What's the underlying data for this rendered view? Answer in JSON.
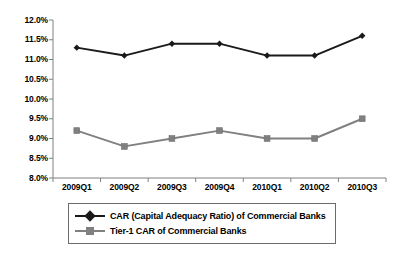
{
  "chart_data": {
    "type": "line",
    "title": "",
    "xlabel": "",
    "ylabel": "",
    "categories": [
      "2009Q1",
      "2009Q2",
      "2009Q3",
      "2009Q4",
      "2010Q1",
      "2010Q2",
      "2010Q3"
    ],
    "series": [
      {
        "name": "CAR (Capital Adequacy Ratio) of Commercial Banks",
        "values": [
          11.3,
          11.1,
          11.4,
          11.4,
          11.1,
          11.1,
          11.6
        ],
        "color": "#1a1a1a",
        "marker": "diamond"
      },
      {
        "name": "Tier-1 CAR of Commercial Banks",
        "values": [
          9.2,
          8.8,
          9.0,
          9.2,
          9.0,
          9.0,
          9.5
        ],
        "color": "#808080",
        "marker": "square"
      }
    ],
    "ylim": [
      8.0,
      12.0
    ],
    "ytick_values": [
      12.0,
      11.5,
      11.0,
      10.5,
      10.0,
      9.5,
      9.0,
      8.5,
      8.0
    ],
    "ytick_labels": [
      "12.0%",
      "11.5%",
      "11.0%",
      "10.5%",
      "10.0%",
      "9.5%",
      "9.0%",
      "8.5%",
      "8.0%"
    ],
    "grid": false,
    "legend_position": "bottom"
  },
  "legend": {
    "entries": [
      {
        "label": "CAR (Capital Adequacy Ratio) of Commercial Banks"
      },
      {
        "label": "Tier-1 CAR of Commercial Banks"
      }
    ]
  }
}
